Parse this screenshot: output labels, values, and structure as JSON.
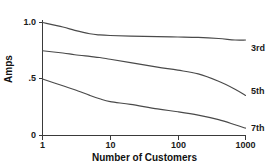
{
  "chart_data": {
    "type": "line",
    "title": "",
    "xlabel": "Number of Customers",
    "ylabel": "Amps",
    "xscale": "log",
    "xlim": [
      1,
      1000
    ],
    "ylim": [
      0,
      1.0
    ],
    "grid": false,
    "legend_position": "right-of-curve-ends",
    "x_tick_labels": [
      "1",
      "10",
      "100",
      "1000"
    ],
    "x_tick_values": [
      1,
      10,
      100,
      1000
    ],
    "y_tick_labels": [
      "0",
      ".5",
      "1.0"
    ],
    "y_tick_values": [
      0,
      0.5,
      1.0
    ],
    "series": [
      {
        "name": "3rd",
        "label": "3rd",
        "x": [
          1,
          2,
          3,
          5,
          7,
          10,
          20,
          50,
          100,
          200,
          400,
          700,
          1000
        ],
        "values": [
          1.0,
          0.96,
          0.93,
          0.9,
          0.89,
          0.885,
          0.88,
          0.875,
          0.872,
          0.868,
          0.858,
          0.845,
          0.845
        ]
      },
      {
        "name": "5th",
        "label": "5th",
        "x": [
          1,
          2,
          3,
          5,
          7,
          10,
          20,
          50,
          100,
          200,
          400,
          700,
          1000
        ],
        "values": [
          0.75,
          0.73,
          0.715,
          0.7,
          0.69,
          0.675,
          0.645,
          0.605,
          0.578,
          0.545,
          0.48,
          0.41,
          0.355
        ]
      },
      {
        "name": "7th",
        "label": "7th",
        "x": [
          1,
          2,
          3,
          5,
          7,
          10,
          20,
          50,
          100,
          200,
          400,
          700,
          1000
        ],
        "values": [
          0.5,
          0.44,
          0.405,
          0.355,
          0.325,
          0.3,
          0.275,
          0.235,
          0.21,
          0.18,
          0.14,
          0.095,
          0.065
        ]
      }
    ]
  },
  "axes": {
    "y_title": "Amps",
    "x_title": "Number of Customers",
    "y_ticks": [
      {
        "label": "1.0",
        "value": 1.0
      },
      {
        "label": ".5",
        "value": 0.5
      },
      {
        "label": "0",
        "value": 0
      }
    ],
    "x_ticks": [
      {
        "label": "1",
        "value": 1
      },
      {
        "label": "10",
        "value": 10
      },
      {
        "label": "100",
        "value": 100
      },
      {
        "label": "1000",
        "value": 1000
      }
    ]
  },
  "series_labels": [
    {
      "text": "3rd"
    },
    {
      "text": "5th"
    },
    {
      "text": "7th"
    }
  ],
  "colors": {
    "background": "#ffffff",
    "axis": "#3a3a3a",
    "curve": "#4a4a4a",
    "text": "#1a1a1a"
  }
}
